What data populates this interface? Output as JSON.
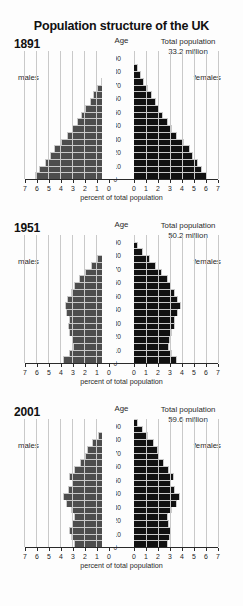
{
  "title": "Population structure of the UK",
  "axis": {
    "age_label": "Age",
    "percent_label": "percent of total population",
    "age_ticks": [
      0,
      10,
      20,
      30,
      40,
      50,
      60,
      70,
      80,
      90
    ],
    "percent_ticks_left": [
      7,
      6,
      5,
      4,
      3,
      2,
      1,
      0
    ],
    "percent_ticks_right": [
      0,
      1,
      2,
      3,
      4,
      5,
      6,
      7
    ],
    "xmax": 7,
    "male_label": "males",
    "female_label": "females",
    "total_prefix": "Total population"
  },
  "colors": {
    "male_bar": "#4d4d4d",
    "female_bar": "#111111",
    "grid": "#c9c9c9",
    "axis": "#2a2a2a",
    "background": "#fdfdfd"
  },
  "chart_data": {
    "type": "bar",
    "subtype": "population-pyramid",
    "title": "Population structure of the UK",
    "xlabel": "percent of total population",
    "ylabel": "Age",
    "xlim": [
      0,
      7
    ],
    "ylim": [
      0,
      95
    ],
    "grid": true,
    "legend": [
      "males",
      "females"
    ],
    "age_bands": [
      "0-4",
      "5-9",
      "10-14",
      "15-19",
      "20-24",
      "25-29",
      "30-34",
      "35-39",
      "40-44",
      "45-49",
      "50-54",
      "55-59",
      "60-64",
      "65-69",
      "70-74",
      "75-79",
      "80-84",
      "85-89",
      "90+"
    ],
    "panels": [
      {
        "year": "1891",
        "total_population": "33.2 million",
        "series": [
          {
            "name": "males",
            "values": [
              6.2,
              5.8,
              5.3,
              4.9,
              4.6,
              4.0,
              3.5,
              3.1,
              2.7,
              2.3,
              2.0,
              1.6,
              1.3,
              1.0,
              0.7,
              0.45,
              0.25,
              0.1,
              0.04
            ]
          },
          {
            "name": "females",
            "values": [
              6.1,
              5.7,
              5.3,
              4.9,
              4.7,
              4.2,
              3.6,
              3.2,
              2.8,
              2.4,
              2.1,
              1.8,
              1.5,
              1.2,
              0.85,
              0.55,
              0.3,
              0.12,
              0.05
            ]
          }
        ]
      },
      {
        "year": "1951",
        "total_population": "50.2 million",
        "series": [
          {
            "name": "males",
            "values": [
              3.8,
              3.3,
              3.0,
              3.1,
              3.3,
              3.4,
              3.3,
              3.6,
              3.7,
              3.5,
              3.2,
              2.9,
              2.5,
              2.0,
              1.5,
              1.0,
              0.55,
              0.22,
              0.06
            ]
          },
          {
            "name": "females",
            "values": [
              3.6,
              3.2,
              2.9,
              3.0,
              3.2,
              3.4,
              3.4,
              3.7,
              3.9,
              3.7,
              3.4,
              3.1,
              2.8,
              2.3,
              1.8,
              1.3,
              0.75,
              0.35,
              0.1
            ]
          }
        ]
      },
      {
        "year": "2001",
        "total_population": "59.6 million",
        "series": [
          {
            "name": "males",
            "values": [
              2.9,
              3.2,
              3.3,
              3.1,
              2.9,
              3.2,
              3.6,
              3.8,
              3.4,
              3.1,
              3.3,
              2.9,
              2.4,
              2.0,
              1.8,
              1.4,
              0.9,
              0.45,
              0.15
            ]
          },
          {
            "name": "females",
            "values": [
              2.8,
              3.0,
              3.1,
              2.9,
              2.8,
              3.2,
              3.6,
              3.8,
              3.4,
              3.1,
              3.3,
              2.9,
              2.5,
              2.1,
              2.0,
              1.7,
              1.2,
              0.75,
              0.3
            ]
          }
        ]
      }
    ]
  }
}
